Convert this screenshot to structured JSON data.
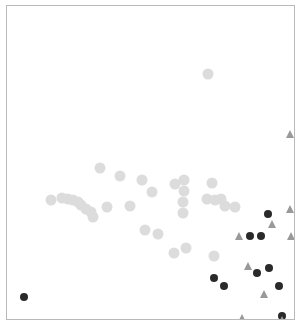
{
  "figure": {
    "title": "",
    "width": 306,
    "height": 333,
    "background": "#ffffff",
    "frame": {
      "border_color": "#b9b9b9",
      "left": 6,
      "top": 5,
      "width": 289,
      "height": 315
    }
  },
  "chart_data": {
    "type": "scatter",
    "title": "",
    "xlabel": "",
    "ylabel": "",
    "grid": false,
    "legend": "none",
    "axis_ticks": [],
    "tick_labels": [],
    "xlim": [
      0,
      289
    ],
    "ylim": [
      0,
      315
    ],
    "note": "Pixel coordinates relative to the plot frame interior; y increases downward.",
    "series": [
      {
        "name": "light-gray-circles",
        "marker": "circle",
        "color": "#dcdcdc",
        "size": 11,
        "points": [
          [
            201,
            68
          ],
          [
            44,
            194
          ],
          [
            55,
            192
          ],
          [
            61,
            193
          ],
          [
            66,
            194
          ],
          [
            71,
            196
          ],
          [
            74,
            199
          ],
          [
            79,
            203
          ],
          [
            84,
            206
          ],
          [
            86,
            211
          ],
          [
            100,
            201
          ],
          [
            123,
            200
          ],
          [
            145,
            186
          ],
          [
            168,
            178
          ],
          [
            177,
            174
          ],
          [
            177,
            185
          ],
          [
            176,
            196
          ],
          [
            176,
            207
          ],
          [
            205,
            177
          ],
          [
            200,
            193
          ],
          [
            208,
            194
          ],
          [
            214,
            193
          ],
          [
            218,
            200
          ],
          [
            228,
            201
          ],
          [
            93,
            162
          ],
          [
            135,
            174
          ],
          [
            113,
            170
          ],
          [
            138,
            224
          ],
          [
            151,
            228
          ],
          [
            167,
            247
          ],
          [
            179,
            242
          ],
          [
            207,
            250
          ]
        ]
      },
      {
        "name": "dark-circles",
        "marker": "circle",
        "color": "#2a2a2a",
        "size": 8,
        "points": [
          [
            17,
            291
          ],
          [
            261,
            208
          ],
          [
            243,
            230
          ],
          [
            254,
            230
          ],
          [
            207,
            272
          ],
          [
            217,
            280
          ],
          [
            250,
            267
          ],
          [
            262,
            262
          ],
          [
            272,
            280
          ],
          [
            275,
            310
          ]
        ]
      },
      {
        "name": "gray-triangles",
        "marker": "triangle",
        "color": "#999999",
        "size": 8,
        "points": [
          [
            283,
            128
          ],
          [
            283,
            203
          ],
          [
            265,
            218
          ],
          [
            232,
            230
          ],
          [
            241,
            260
          ],
          [
            257,
            288
          ],
          [
            235,
            312
          ],
          [
            275,
            314
          ],
          [
            284,
            230
          ]
        ]
      }
    ]
  }
}
